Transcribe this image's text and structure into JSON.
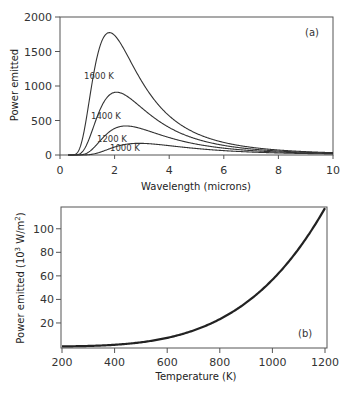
{
  "chart_data": [
    {
      "type": "line",
      "panel": "(a)",
      "title": "",
      "xlabel": "Wavelength (microns)",
      "ylabel": "Power emitted",
      "xlim": [
        0,
        10
      ],
      "ylim": [
        0,
        2000
      ],
      "xticks": [
        0,
        2,
        4,
        6,
        8,
        10
      ],
      "yticks": [
        0,
        500,
        1000,
        1500,
        2000
      ],
      "grid": false,
      "legend": "inline labels",
      "model": "Planck blackbody spectral radiance (scaled)",
      "series": [
        {
          "name": "1600 K",
          "T": 1600,
          "peak_x": 1.81,
          "peak_y": 1780,
          "x": [
            0.5,
            1,
            1.5,
            1.81,
            2,
            3,
            4,
            5,
            6,
            8,
            10
          ],
          "values": [
            3,
            570,
            1590,
            1780,
            1760,
            1110,
            600,
            335,
            200,
            83,
            41
          ]
        },
        {
          "name": "1400 K",
          "T": 1400,
          "peak_x": 2.07,
          "peak_y": 913,
          "x": [
            0.5,
            1,
            1.5,
            2.07,
            3,
            4,
            5,
            6,
            8,
            10
          ],
          "values": [
            0,
            170,
            660,
            913,
            700,
            410,
            240,
            150,
            64,
            32
          ]
        },
        {
          "name": "1200 K",
          "T": 1200,
          "peak_x": 2.42,
          "peak_y": 422,
          "x": [
            0.5,
            1,
            1.5,
            2.42,
            3,
            4,
            5,
            6,
            8,
            10
          ],
          "values": [
            0,
            35,
            210,
            422,
            390,
            260,
            160,
            105,
            47,
            24
          ]
        },
        {
          "name": "1000 K",
          "T": 1000,
          "peak_x": 2.9,
          "peak_y": 170,
          "x": [
            0.5,
            1,
            1.5,
            2.9,
            4,
            5,
            6,
            8,
            10
          ],
          "values": [
            0,
            5,
            45,
            170,
            140,
            95,
            65,
            31,
            17
          ]
        }
      ],
      "annotations": [
        "1600 K",
        "1400 K",
        "1200 K",
        "1000 K",
        "(a)"
      ]
    },
    {
      "type": "line",
      "panel": "(b)",
      "title": "",
      "xlabel": "Temperature (K)",
      "ylabel": "Power emitted (10^3 W/m^2)",
      "xlim": [
        200,
        1200
      ],
      "ylim": [
        0,
        118
      ],
      "xticks": [
        200,
        400,
        600,
        800,
        1000,
        1200
      ],
      "yticks": [
        20,
        40,
        60,
        80,
        100
      ],
      "grid": false,
      "model": "Stefan-Boltzmann sigma*T^4",
      "series": [
        {
          "name": "sigma T^4",
          "x": [
            200,
            300,
            400,
            500,
            600,
            700,
            800,
            900,
            1000,
            1100,
            1200
          ],
          "values": [
            0.09,
            0.46,
            1.45,
            3.54,
            7.35,
            13.6,
            23.2,
            37.2,
            56.7,
            83.0,
            117.6
          ]
        }
      ],
      "annotations": [
        "(b)"
      ]
    }
  ],
  "labels": {
    "a": {
      "xlabel": "Wavelength (microns)",
      "ylabel": "Power emitted",
      "panel": "(a)",
      "xticks": [
        "0",
        "2",
        "4",
        "6",
        "8",
        "10"
      ],
      "yticks": [
        "0",
        "500",
        "1000",
        "1500",
        "2000"
      ],
      "curves": [
        "1600 K",
        "1400 K",
        "1200 K",
        "1000 K"
      ]
    },
    "b": {
      "xlabel": "Temperature (K)",
      "ylabel_main": "Power emitted (10",
      "ylabel_sup1": "3",
      "ylabel_mid": " W/m",
      "ylabel_sup2": "2",
      "ylabel_end": ")",
      "panel": "(b)",
      "xticks": [
        "200",
        "400",
        "600",
        "800",
        "1000",
        "1200"
      ],
      "yticks": [
        "20",
        "40",
        "60",
        "80",
        "100"
      ]
    }
  }
}
